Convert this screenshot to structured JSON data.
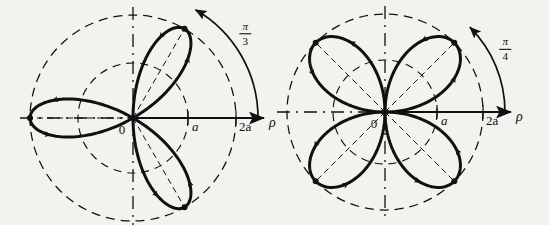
{
  "figure": {
    "background_color": "#f3f2ef",
    "ink_color": "#101010",
    "panels": [
      {
        "id": "left",
        "name": "three-petal-rose",
        "curve_equation": "rho = 2a cos(3phi)",
        "petal_count": 3,
        "petal_axis_angles_deg": [
          60,
          180,
          300
        ],
        "max_radius_label": "2a",
        "inner_circle_label": "a",
        "angle_label": {
          "numerator": "π",
          "denominator": "3"
        },
        "origin_label": "0",
        "axis_label": "ρ",
        "tick_labels": [
          "a",
          "2a"
        ],
        "center_px": [
          133,
          118
        ],
        "radius_2a_px": 103,
        "radius_a_px": 55
      },
      {
        "id": "right",
        "name": "four-petal-rose",
        "curve_equation": "rho = 2a cos(2phi)",
        "petal_count": 4,
        "petal_axis_angles_deg": [
          45,
          135,
          225,
          315
        ],
        "max_radius_label": "2a",
        "inner_circle_label": "a",
        "angle_label": {
          "numerator": "π",
          "denominator": "4"
        },
        "origin_label": "0",
        "axis_label": "ρ",
        "tick_labels": [
          "a",
          "2a"
        ],
        "center_px": [
          385,
          112
        ],
        "radius_2a_px": 98,
        "radius_a_px": 52
      }
    ]
  },
  "chart_data": {
    "type": "line",
    "xlabel": "ρ",
    "ylabel": "",
    "grid": false,
    "legend_position": "none",
    "series": [
      {
        "name": "three-petal rose",
        "k": 3,
        "amplitude_label": "2a",
        "angle_between_petals_label": "π/3",
        "petal_tip_angles_deg": [
          60,
          180,
          300
        ],
        "petal_tip_radius": "2a",
        "axis_ticks": [
          "a",
          "2a"
        ]
      },
      {
        "name": "four-petal rose",
        "k": 2,
        "amplitude_label": "2a",
        "angle_between_petals_label": "π/4",
        "petal_tip_angles_deg": [
          45,
          135,
          225,
          315
        ],
        "petal_tip_radius": "2a",
        "axis_ticks": [
          "a",
          "2a"
        ]
      }
    ]
  }
}
